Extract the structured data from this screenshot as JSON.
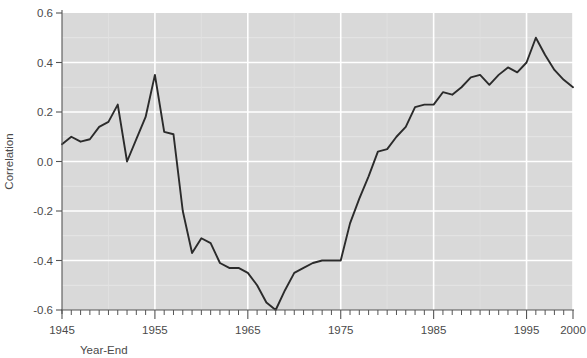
{
  "chart_data": {
    "type": "line",
    "title": "",
    "xlabel": "Year-End",
    "ylabel": "Correlation",
    "xlim": [
      1945,
      2000
    ],
    "ylim": [
      -0.6,
      0.6
    ],
    "grid": true,
    "legend": false,
    "x_tick_labels": [
      "1945",
      "1955",
      "1965",
      "1975",
      "1985",
      "1995",
      "2000"
    ],
    "x_tick_values": [
      1945,
      1955,
      1965,
      1975,
      1985,
      1995,
      2000
    ],
    "y_tick_labels": [
      "0.6",
      "0.4",
      "0.2",
      "0.0",
      "-0.2",
      "-0.4",
      "-0.6"
    ],
    "y_tick_values": [
      0.6,
      0.4,
      0.2,
      0.0,
      -0.2,
      -0.4,
      -0.6
    ],
    "x_minor_tick_step": 1,
    "series": [
      {
        "name": "Correlation",
        "color": "#2b2b2b",
        "x": [
          1945,
          1946,
          1947,
          1948,
          1949,
          1950,
          1951,
          1952,
          1953,
          1954,
          1955,
          1956,
          1957,
          1958,
          1959,
          1960,
          1961,
          1962,
          1963,
          1964,
          1965,
          1966,
          1967,
          1968,
          1969,
          1970,
          1971,
          1972,
          1973,
          1974,
          1975,
          1976,
          1977,
          1978,
          1979,
          1980,
          1981,
          1982,
          1983,
          1984,
          1985,
          1986,
          1987,
          1988,
          1989,
          1990,
          1991,
          1992,
          1993,
          1994,
          1995,
          1996,
          1997,
          1998,
          1999,
          2000
        ],
        "y": [
          0.07,
          0.1,
          0.08,
          0.09,
          0.14,
          0.16,
          0.23,
          0.0,
          0.09,
          0.18,
          0.35,
          0.12,
          0.11,
          -0.2,
          -0.37,
          -0.31,
          -0.33,
          -0.41,
          -0.43,
          -0.43,
          -0.45,
          -0.5,
          -0.57,
          -0.6,
          -0.52,
          -0.45,
          -0.43,
          -0.41,
          -0.4,
          -0.4,
          -0.4,
          -0.25,
          -0.15,
          -0.06,
          0.04,
          0.05,
          0.1,
          0.14,
          0.22,
          0.23,
          0.23,
          0.28,
          0.27,
          0.3,
          0.34,
          0.35,
          0.31,
          0.35,
          0.38,
          0.36,
          0.4,
          0.5,
          0.43,
          0.37,
          0.33,
          0.3
        ]
      }
    ]
  },
  "geometry": {
    "plot_left": 62,
    "plot_right": 573,
    "plot_top": 13,
    "plot_bottom": 310
  },
  "axes": {
    "y_axis_title": "Correlation",
    "x_axis_title": "Year-End"
  },
  "colors": {
    "plot_background": "#d9d9d9",
    "line": "#2b2b2b",
    "gridline": "#ffffff",
    "text": "#4a4a4a",
    "page_background": "#ffffff"
  }
}
